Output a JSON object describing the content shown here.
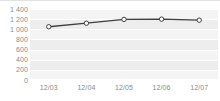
{
  "chart_data": {
    "type": "line",
    "title": "",
    "subtitle": "",
    "xlabel": "",
    "ylabel": "",
    "categories": [
      "12/03",
      "12/04",
      "12/05",
      "12/06",
      "12/07"
    ],
    "series": [
      {
        "name": "",
        "values": [
          1050,
          1120,
          1195,
          1200,
          1180
        ],
        "line_color": "#3f3f3f",
        "marker_fill": "#ffffff",
        "marker_stroke": "#3f3f3f"
      }
    ],
    "ylim": [
      0,
      1400
    ],
    "ytick_step": 200,
    "ytick_labels": [
      "1 400",
      "1 200",
      "1 000",
      "800",
      "600",
      "400",
      "200",
      "0"
    ],
    "ytick_values": [
      1400,
      1200,
      1000,
      800,
      600,
      400,
      200,
      0
    ],
    "xtick_labels": [
      "12/03",
      "12/04",
      "12/05",
      "12/06",
      "12/07"
    ],
    "grid": true,
    "grid_color": "#ffffff",
    "plot_background": "#ededed",
    "band_color": "#f4f4f4",
    "legend": false,
    "legend_position": "none",
    "axis_label_color": "#8a8a8a"
  }
}
